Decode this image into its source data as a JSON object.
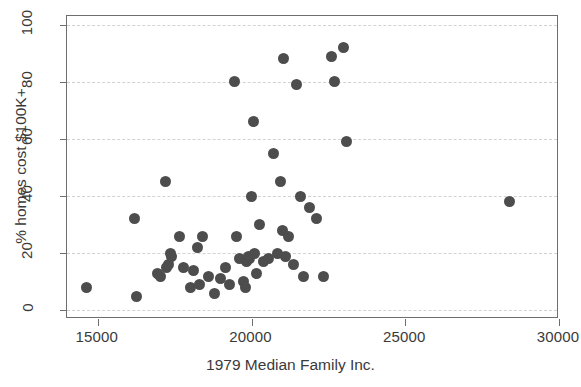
{
  "chart_data": {
    "type": "scatter",
    "title": "",
    "xlabel": "1979 Median Family Inc.",
    "ylabel": "% homes cost $100K+",
    "xlim": [
      14000,
      30000
    ],
    "ylim": [
      -3,
      103
    ],
    "xticks": [
      15000,
      20000,
      25000,
      30000
    ],
    "xtick_labels": [
      "15000",
      "20000",
      "25000",
      "30000"
    ],
    "yticks": [
      0,
      20,
      40,
      60,
      80,
      100
    ],
    "ytick_labels": [
      "0",
      "20",
      "40",
      "60",
      "80",
      "100"
    ],
    "grid": "horizontal-dashed",
    "legend": null,
    "marker": {
      "shape": "circle",
      "color": "#4d4d4d",
      "size": 11
    },
    "n_points": 56,
    "x": [
      14650,
      16200,
      16250,
      16950,
      17050,
      17200,
      17250,
      17300,
      17350,
      17400,
      17650,
      17800,
      18000,
      18100,
      18250,
      18300,
      18400,
      18600,
      18800,
      19000,
      19150,
      19300,
      19450,
      19500,
      19600,
      19750,
      19800,
      19850,
      19900,
      19950,
      20000,
      20050,
      20100,
      20150,
      20250,
      20400,
      20550,
      20700,
      20850,
      20950,
      21000,
      21050,
      21100,
      21200,
      21350,
      21450,
      21600,
      21700,
      21900,
      22100,
      22350,
      22600,
      22700,
      23000,
      23100,
      28400
    ],
    "y": [
      8,
      32,
      5,
      13,
      12,
      45,
      15,
      16,
      20,
      19,
      26,
      15,
      8,
      14,
      22,
      9,
      26,
      12,
      6,
      11,
      15,
      9,
      80,
      26,
      18,
      10,
      8,
      17,
      19,
      18,
      40,
      66,
      20,
      13,
      30,
      17,
      18,
      55,
      20,
      45,
      28,
      88,
      19,
      26,
      16,
      79,
      40,
      12,
      36,
      32,
      12,
      89,
      80,
      92,
      59,
      38
    ]
  },
  "points": [
    {
      "x": 14650,
      "y": 8
    },
    {
      "x": 16200,
      "y": 32
    },
    {
      "x": 16250,
      "y": 5
    },
    {
      "x": 16950,
      "y": 13
    },
    {
      "x": 17050,
      "y": 12
    },
    {
      "x": 17200,
      "y": 45
    },
    {
      "x": 17250,
      "y": 15
    },
    {
      "x": 17300,
      "y": 16
    },
    {
      "x": 17350,
      "y": 20
    },
    {
      "x": 17400,
      "y": 19
    },
    {
      "x": 17650,
      "y": 26
    },
    {
      "x": 17800,
      "y": 15
    },
    {
      "x": 18000,
      "y": 8
    },
    {
      "x": 18100,
      "y": 14
    },
    {
      "x": 18250,
      "y": 22
    },
    {
      "x": 18300,
      "y": 9
    },
    {
      "x": 18400,
      "y": 26
    },
    {
      "x": 18600,
      "y": 12
    },
    {
      "x": 18800,
      "y": 6
    },
    {
      "x": 19000,
      "y": 11
    },
    {
      "x": 19150,
      "y": 15
    },
    {
      "x": 19300,
      "y": 9
    },
    {
      "x": 19450,
      "y": 80
    },
    {
      "x": 19500,
      "y": 26
    },
    {
      "x": 19600,
      "y": 18
    },
    {
      "x": 19750,
      "y": 10
    },
    {
      "x": 19800,
      "y": 8
    },
    {
      "x": 19850,
      "y": 17
    },
    {
      "x": 19900,
      "y": 19
    },
    {
      "x": 19950,
      "y": 18
    },
    {
      "x": 20000,
      "y": 40
    },
    {
      "x": 20050,
      "y": 66
    },
    {
      "x": 20100,
      "y": 20
    },
    {
      "x": 20150,
      "y": 13
    },
    {
      "x": 20250,
      "y": 30
    },
    {
      "x": 20400,
      "y": 17
    },
    {
      "x": 20550,
      "y": 18
    },
    {
      "x": 20700,
      "y": 55
    },
    {
      "x": 20850,
      "y": 20
    },
    {
      "x": 20950,
      "y": 45
    },
    {
      "x": 21000,
      "y": 28
    },
    {
      "x": 21050,
      "y": 88
    },
    {
      "x": 21100,
      "y": 19
    },
    {
      "x": 21200,
      "y": 26
    },
    {
      "x": 21350,
      "y": 16
    },
    {
      "x": 21450,
      "y": 79
    },
    {
      "x": 21600,
      "y": 40
    },
    {
      "x": 21700,
      "y": 12
    },
    {
      "x": 21900,
      "y": 36
    },
    {
      "x": 22100,
      "y": 32
    },
    {
      "x": 22350,
      "y": 12
    },
    {
      "x": 22600,
      "y": 89
    },
    {
      "x": 22700,
      "y": 80
    },
    {
      "x": 23000,
      "y": 92
    },
    {
      "x": 23100,
      "y": 59
    },
    {
      "x": 28400,
      "y": 38
    }
  ],
  "colors": {
    "marker": "#4d4d4d",
    "frame": "#6e6e6e",
    "grid": "#d2d2d2",
    "text": "#3a3a3a",
    "background": "#ffffff"
  }
}
